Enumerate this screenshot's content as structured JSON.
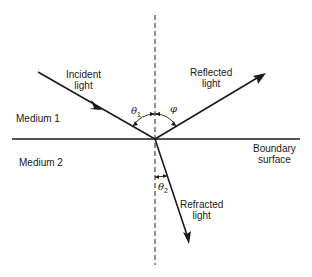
{
  "diagram": {
    "type": "optics-reflection-refraction",
    "labels": {
      "incident": [
        "Incident",
        "light"
      ],
      "reflected": [
        "Reflected",
        "light"
      ],
      "refracted": [
        "Refracted",
        "light"
      ],
      "boundary": [
        "Boundary",
        "surface"
      ],
      "medium1": "Medium 1",
      "medium2": "Medium 2",
      "theta1": "θ",
      "theta1_sub": "1",
      "phi": "φ",
      "theta2": "θ",
      "theta2_sub": "2"
    },
    "colors": {
      "ink": "#1a1a1a",
      "background": "#ffffff"
    },
    "geometry": {
      "incidence_point": [
        155,
        139
      ],
      "normal_line": {
        "x": 155,
        "y1": 15,
        "y2": 265,
        "style": "dashed"
      },
      "boundary_line": {
        "y": 139,
        "x1": 12,
        "x2": 300
      },
      "incident_ray": {
        "from": [
          38,
          72
        ],
        "to": [
          155,
          139
        ]
      },
      "reflected_ray": {
        "from": [
          155,
          139
        ],
        "to": [
          265,
          73
        ]
      },
      "refracted_ray": {
        "from": [
          155,
          139
        ],
        "to": [
          189,
          243
        ]
      }
    }
  }
}
